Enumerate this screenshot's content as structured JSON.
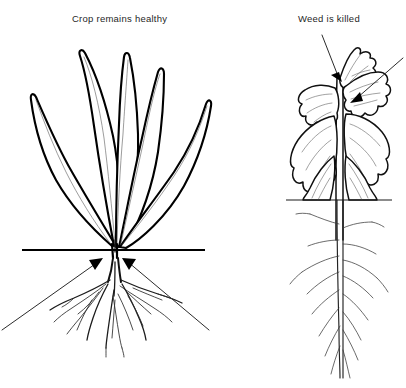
{
  "figure": {
    "background_color": "#ffffff",
    "ink_color": "#000000",
    "width": 406,
    "height": 388
  },
  "labels": {
    "crop": "Crop remains healthy",
    "weed": "Weed is killed"
  },
  "panels": [
    {
      "id": "crop",
      "label": "Crop remains healthy",
      "plant_type": "grass crop",
      "leaf_count": 5,
      "leaf_shape": "long narrow lanceolate blades",
      "root_type": "fibrous root system",
      "condition": "healthy, upright",
      "soil_line_y": 250,
      "arrow_count": 2,
      "arrow_target": "root crown at soil line"
    },
    {
      "id": "weed",
      "label": "Weed is killed",
      "plant_type": "broadleaf weed",
      "leaf_count": 6,
      "leaf_shape": "broad crinkled drooping blades",
      "root_type": "taproot with lateral branches",
      "condition": "wilted, leaves hanging down",
      "soil_line_y": 200,
      "arrow_count": 2,
      "arrow_target": "stem nodes and leaf axils"
    }
  ],
  "annotations": {
    "crop_arrows": [
      {
        "name": "lower-left arrow to crop crown",
        "from_x": 2,
        "from_y": 330,
        "to_x": 103,
        "to_y": 258
      },
      {
        "name": "lower-right arrow to crop crown",
        "from_x": 209,
        "from_y": 330,
        "to_x": 122,
        "to_y": 258
      }
    ],
    "weed_arrows": [
      {
        "name": "upper-left arrow to weed stem",
        "from_x": 322,
        "from_y": 35,
        "to_x": 342,
        "to_y": 82
      },
      {
        "name": "upper-right arrow to weed axil",
        "from_x": 403,
        "from_y": 58,
        "to_x": 350,
        "to_y": 102
      }
    ]
  }
}
